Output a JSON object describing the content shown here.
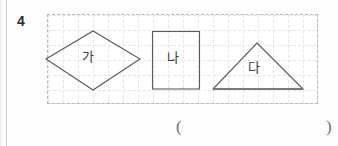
{
  "question": {
    "number": "4"
  },
  "grid": {
    "cell_size_px": 15,
    "border_style": "dashed",
    "line_color": "#e6e6e6",
    "border_color": "#b9b9b9"
  },
  "figures": [
    {
      "id": "diamond",
      "label": "가",
      "shape": "rhombus",
      "stroke_color": "#5a5a5a"
    },
    {
      "id": "rectangle",
      "label": "나",
      "shape": "rectangle",
      "stroke_color": "#5a5a5a"
    },
    {
      "id": "triangle",
      "label": "다",
      "shape": "triangle",
      "stroke_color": "#5a5a5a"
    }
  ],
  "answer_blank": {
    "open": "(",
    "close": ")"
  }
}
